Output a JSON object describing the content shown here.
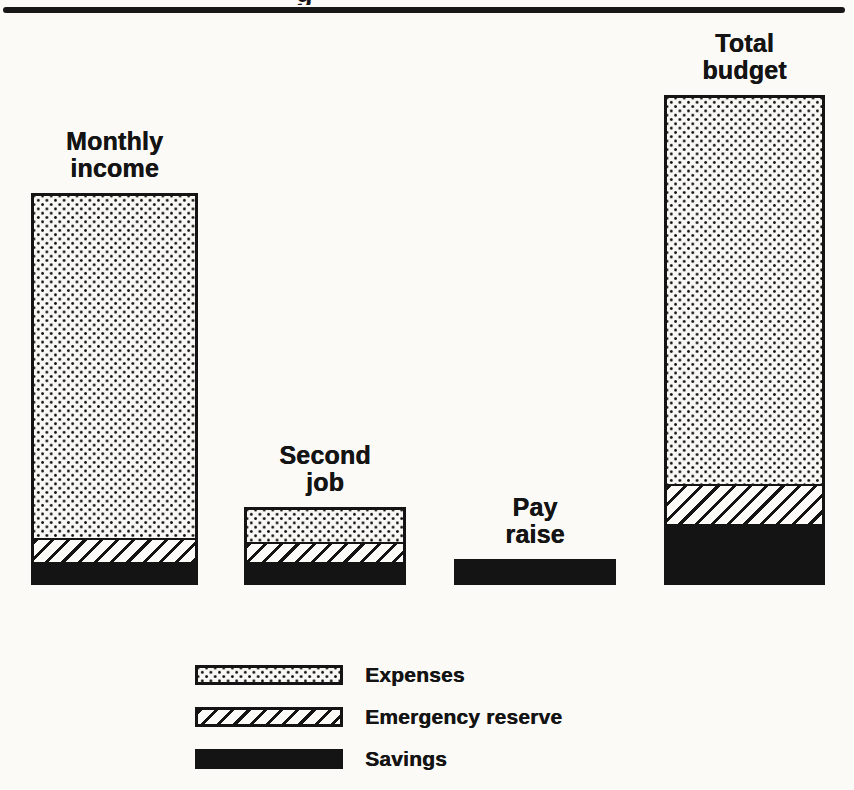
{
  "header": {
    "partial_glyph": "g"
  },
  "chart_data": {
    "type": "bar",
    "stacked": true,
    "title": "",
    "xlabel": "",
    "ylabel": "",
    "value_axis": "none (qualitative chart, no ticks or gridlines; values are relative heights)",
    "unit": "relative height units (screen px)",
    "categories": [
      "Monthly income",
      "Second job",
      "Pay raise",
      "Total budget"
    ],
    "categories_lines": [
      [
        "Monthly",
        "income"
      ],
      [
        "Second",
        "job"
      ],
      [
        "Pay",
        "raise"
      ],
      [
        "Total",
        "budget"
      ]
    ],
    "series": [
      {
        "name": "Expenses",
        "pattern": "dots",
        "values": [
          342,
          32,
          0,
          386
        ]
      },
      {
        "name": "Emergency reserve",
        "pattern": "hatch",
        "values": [
          22,
          18,
          0,
          38
        ]
      },
      {
        "name": "Savings",
        "pattern": "solid",
        "values": [
          20,
          20,
          20,
          58
        ]
      }
    ],
    "legend_position": "bottom-left",
    "grid": false,
    "colors": {
      "ink": "#141414",
      "paper": "#fbfaf7"
    },
    "layout": {
      "baseline_y": 585,
      "bar_lefts": [
        34,
        247,
        457,
        667
      ],
      "bar_widths": [
        161,
        156,
        156,
        155
      ]
    }
  }
}
